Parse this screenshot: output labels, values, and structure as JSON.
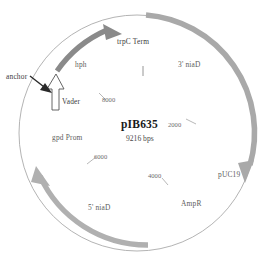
{
  "figure": {
    "type": "plasmid-map",
    "name": "pIB635",
    "size": "9216 bps",
    "backbone_circle": {
      "cx": 137,
      "cy": 133,
      "r": 118
    }
  },
  "center": {
    "name_label": "pIB635",
    "size_label": "9216 bps"
  },
  "features": [
    {
      "id": "hph",
      "label": "hph",
      "type": "arc-arrow",
      "direction": "clockwise",
      "color": "#8a8a8a",
      "start_deg": 288,
      "end_deg": 333,
      "label_x": 75,
      "label_y": 64
    },
    {
      "id": "trpC-term",
      "label": "trpC Term",
      "type": "text-only",
      "color": "#4a4a4a",
      "label_x": 117,
      "label_y": 41
    },
    {
      "id": "3-niaD",
      "label": "3' niaD",
      "type": "arc-arrow",
      "direction": "clockwise",
      "color": "#a9a9a9",
      "start_deg": 352,
      "end_deg": 62,
      "label_x": 178,
      "label_y": 63
    },
    {
      "id": "pUC19",
      "label": "pUC19",
      "type": "text-only",
      "color": "#5d5d5d",
      "label_x": 218,
      "label_y": 174
    },
    {
      "id": "AmpR",
      "label": "AmpR",
      "type": "text-only",
      "color": "#5d5d5d",
      "label_x": 181,
      "label_y": 203
    },
    {
      "id": "5-niaD",
      "label": "5' niaD",
      "type": "arc-arrow",
      "direction": "counter-clockwise",
      "color": "#a9a9a9",
      "start_deg": 100,
      "end_deg": 185,
      "label_x": 88,
      "label_y": 207
    },
    {
      "id": "gpd-prom",
      "label": "gpd Prom",
      "type": "text-only",
      "color": "#5d5d5d",
      "label_x": 52,
      "label_y": 137
    },
    {
      "id": "Vader",
      "label": "Vader",
      "type": "box-arrow",
      "color": "#4a4a4a",
      "label_x": 59,
      "label_y": 101
    },
    {
      "id": "anchor",
      "label": "anchor",
      "type": "annotation-arrow",
      "color": "#2a2a2a",
      "label_x": 9,
      "label_y": 76
    }
  ],
  "ticks": [
    {
      "value": "2000",
      "label_x": 168,
      "label_y": 125
    },
    {
      "value": "4000",
      "label_x": 148,
      "label_y": 176
    },
    {
      "value": "6000",
      "label_x": 94,
      "label_y": 157
    },
    {
      "value": "8000",
      "label_x": 102,
      "label_y": 99
    }
  ],
  "origin_marker": {
    "x": 143,
    "y": 68,
    "length": 9
  },
  "colors": {
    "background": "#ffffff",
    "backbone": "#9a9a9a",
    "arrow_light": "#a9a9a9",
    "arrow_dark": "#8a8a8a",
    "text": "#5d5d5d",
    "text_dark": "#1a1a1a",
    "anchor_arrow": "#2a2a2a"
  }
}
